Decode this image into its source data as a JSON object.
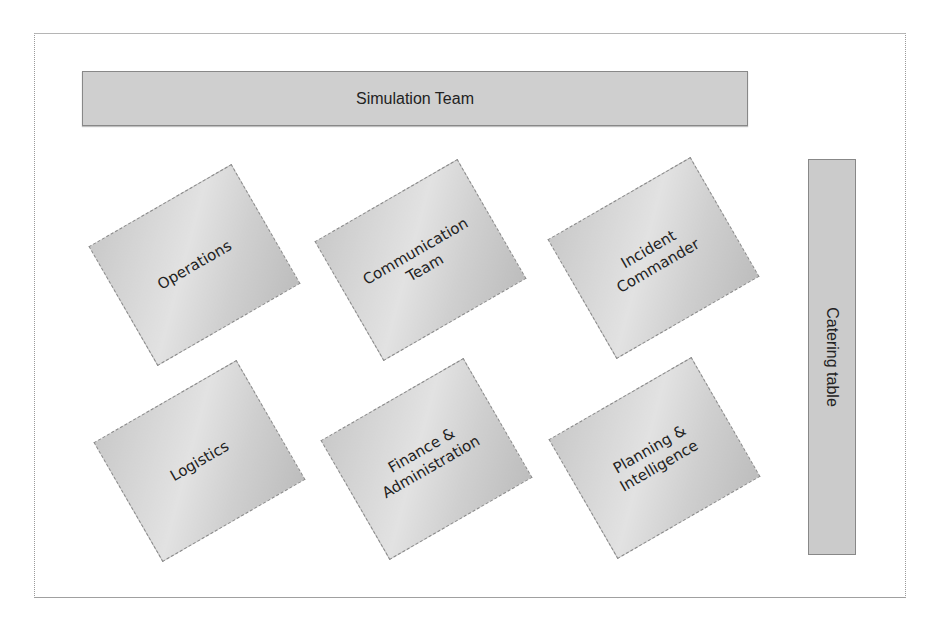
{
  "diagram": {
    "title_bar": {
      "label": "Simulation Team"
    },
    "side_bar": {
      "label": "Catering table"
    },
    "stations": [
      {
        "label": "Operations"
      },
      {
        "label": "Communication\nTeam"
      },
      {
        "label": "Incident\nCommander"
      },
      {
        "label": "Logistics"
      },
      {
        "label": "Finance &\nAdministration"
      },
      {
        "label": "Planning &\nIntelligence"
      }
    ],
    "colors": {
      "bar_fill": "#cfcfcf",
      "card_fill": "#d6d6d6",
      "border": "#888888",
      "text": "#222222"
    }
  }
}
